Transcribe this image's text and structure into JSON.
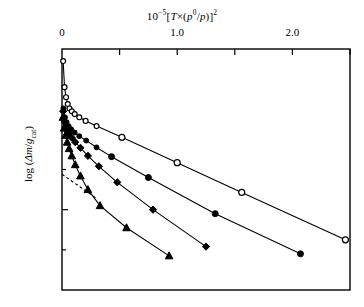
{
  "chart_data": {
    "type": "scatter",
    "title_parts": {
      "prefix": "10",
      "exp": "−5",
      "open": "[",
      "T": "T",
      "times": "×(",
      "p0": "p",
      "p0sup": "0",
      "slash": "/",
      "p": "p",
      "close": ")]",
      "sq": "2"
    },
    "xlabel": "10−5[T×(p0/p)]2",
    "ylabel": "log (Δm/gcat)",
    "ylabel_parts": {
      "lead": "log (",
      "delta": "Δm",
      "slash": "/",
      "g": "g",
      "sub": "cat",
      "tail": ")"
    },
    "xlim": [
      0,
      2.5
    ],
    "ylim": [
      -0.9,
      -0.3
    ],
    "xticks": [
      0,
      0.5,
      1.0,
      1.5,
      2.0,
      2.5
    ],
    "xtick_labels": [
      "0",
      "",
      "1.0",
      "",
      "2.0",
      ""
    ],
    "yticks": [
      -0.3,
      -0.4,
      -0.5,
      -0.6,
      -0.7,
      -0.8,
      -0.9
    ],
    "ytick_labels": [
      "−0.3",
      "",
      "−0.5",
      "",
      "−0.7",
      "",
      "−0.9"
    ],
    "grid": false,
    "legend": "none",
    "ticks_inward": true,
    "frame": true,
    "series": [
      {
        "name": "open-circle-series",
        "marker": "open-circle",
        "line": "solid",
        "points": [
          [
            0.01,
            -0.33
          ],
          [
            0.022,
            -0.395
          ],
          [
            0.035,
            -0.42
          ],
          [
            0.05,
            -0.437
          ],
          [
            0.065,
            -0.448
          ],
          [
            0.085,
            -0.455
          ],
          [
            0.11,
            -0.462
          ],
          [
            0.15,
            -0.47
          ],
          [
            0.205,
            -0.479
          ],
          [
            0.3,
            -0.492
          ],
          [
            0.52,
            -0.52
          ],
          [
            1.0,
            -0.583
          ],
          [
            1.56,
            -0.657
          ],
          [
            2.46,
            -0.775
          ]
        ]
      },
      {
        "name": "filled-circle-series",
        "marker": "filled-circle",
        "line": "solid",
        "points": [
          [
            0.012,
            -0.448
          ],
          [
            0.026,
            -0.47
          ],
          [
            0.04,
            -0.482
          ],
          [
            0.058,
            -0.492
          ],
          [
            0.08,
            -0.5
          ],
          [
            0.11,
            -0.508
          ],
          [
            0.15,
            -0.517
          ],
          [
            0.21,
            -0.528
          ],
          [
            0.3,
            -0.545
          ],
          [
            0.43,
            -0.568
          ],
          [
            0.75,
            -0.62
          ],
          [
            1.33,
            -0.71
          ],
          [
            2.07,
            -0.81
          ]
        ]
      },
      {
        "name": "filled-diamond-series",
        "marker": "filled-diamond",
        "line": "solid",
        "points": [
          [
            0.01,
            -0.455
          ],
          [
            0.024,
            -0.482
          ],
          [
            0.04,
            -0.498
          ],
          [
            0.06,
            -0.51
          ],
          [
            0.085,
            -0.521
          ],
          [
            0.115,
            -0.532
          ],
          [
            0.16,
            -0.546
          ],
          [
            0.225,
            -0.566
          ],
          [
            0.32,
            -0.592
          ],
          [
            0.48,
            -0.632
          ],
          [
            0.79,
            -0.7
          ],
          [
            1.25,
            -0.792
          ]
        ]
      },
      {
        "name": "filled-triangle-series",
        "marker": "filled-triangle",
        "line": "solid",
        "points": [
          [
            0.008,
            -0.47
          ],
          [
            0.018,
            -0.497
          ],
          [
            0.03,
            -0.515
          ],
          [
            0.045,
            -0.532
          ],
          [
            0.062,
            -0.548
          ],
          [
            0.085,
            -0.566
          ],
          [
            0.115,
            -0.588
          ],
          [
            0.16,
            -0.616
          ],
          [
            0.225,
            -0.65
          ],
          [
            0.33,
            -0.69
          ],
          [
            0.56,
            -0.745
          ],
          [
            0.93,
            -0.815
          ]
        ]
      }
    ],
    "dashed_line": {
      "name": "dashed-guide-line",
      "style": "dashed",
      "points": [
        [
          0.0,
          -0.612
        ],
        [
          0.3,
          -0.672
        ]
      ]
    },
    "colors": {
      "axis": "#000000",
      "data": "#000000",
      "background": "#ffffff"
    }
  }
}
